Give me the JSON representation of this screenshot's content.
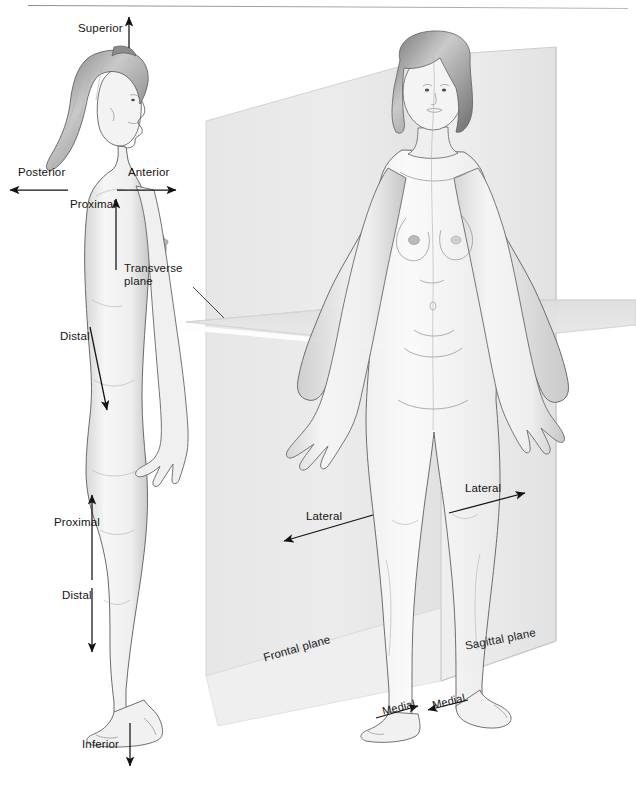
{
  "figure": {
    "title_visible_fragment": "",
    "background_color": "#ffffff",
    "ink_color": "#141414"
  },
  "left_figure": {
    "name": "lateral-view-female-body",
    "description": "Female figure in right lateral (side) profile showing superior/inferior, anterior/posterior and proximal/distal directional terms",
    "labels": [
      {
        "id": "superior",
        "text": "Superior",
        "arrow": "up",
        "x": 78,
        "y": 28
      },
      {
        "id": "posterior",
        "text": "Posterior",
        "arrow": "left",
        "x": 18,
        "y": 172
      },
      {
        "id": "anterior",
        "text": "Anterior",
        "arrow": "right",
        "x": 128,
        "y": 172
      },
      {
        "id": "proximal-arm",
        "text": "Proximal",
        "arrow": "up",
        "x": 70,
        "y": 203
      },
      {
        "id": "distal-arm",
        "text": "Distal",
        "arrow": "down-right",
        "x": 76,
        "y": 337
      },
      {
        "id": "proximal-leg",
        "text": "Proximal",
        "arrow": "up",
        "x": 72,
        "y": 521
      },
      {
        "id": "distal-leg",
        "text": "Distal",
        "arrow": "down",
        "x": 76,
        "y": 594
      },
      {
        "id": "inferior",
        "text": "Inferior",
        "arrow": "down",
        "x": 88,
        "y": 745
      }
    ]
  },
  "right_figure": {
    "name": "anterior-view-female-body-with-planes",
    "description": "Female figure in anterior view intersected by three anatomical planes",
    "planes": [
      {
        "id": "frontal-plane",
        "label": "Frontal plane",
        "orientation": "coronal-vertical",
        "fill": "#ebebeb",
        "rotation_deg": -18,
        "x": 265,
        "y": 657
      },
      {
        "id": "sagittal-plane",
        "label": "Sagittal plane",
        "orientation": "midsagittal-vertical",
        "fill": "#e4e4e4",
        "rotation_deg": -11,
        "x": 466,
        "y": 644
      },
      {
        "id": "transverse-plane",
        "label": "Transverse plane",
        "orientation": "horizontal",
        "fill": "#e0e0e0",
        "rotation_deg": 0,
        "x": 182,
        "y": 268
      }
    ],
    "labels": [
      {
        "id": "lateral-left",
        "text": "Lateral",
        "arrow": "left",
        "x": 307,
        "y": 516
      },
      {
        "id": "lateral-right",
        "text": "Lateral",
        "arrow": "right",
        "x": 466,
        "y": 489
      },
      {
        "id": "medial-left",
        "text": "Medial",
        "arrow": "right",
        "x": 386,
        "y": 707
      },
      {
        "id": "medial-right",
        "text": "Medial",
        "arrow": "left",
        "x": 434,
        "y": 703
      }
    ]
  },
  "colors": {
    "plane_light": "#ededed",
    "plane_mid": "#e3e3e3",
    "plane_dark": "#d8d8d8",
    "plane_edge": "#cfcfcf",
    "skin_light": "#f4f4f4",
    "skin_shadow": "#c9c9c9",
    "hair_dark": "#6a6a6a",
    "line": "#141414"
  }
}
